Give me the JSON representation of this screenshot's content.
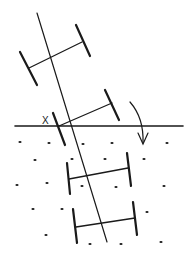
{
  "diagram": {
    "label_x": "X",
    "colors": {
      "ink": "#1a1a1a",
      "background": "#ffffff"
    },
    "ground_line": {
      "x1": 15,
      "y1": 126,
      "x2": 183,
      "y2": 126
    },
    "main_axis": {
      "x1": 37,
      "y1": 13,
      "x2": 107,
      "y2": 242
    },
    "rungs": [
      {
        "left_bar": [
          20,
          52,
          37,
          85
        ],
        "right_bar": [
          76,
          25,
          90,
          56
        ],
        "rung": [
          29,
          68,
          82,
          42
        ]
      },
      {
        "left_bar": [
          53,
          113,
          65,
          145
        ],
        "right_bar": [
          105,
          90,
          119,
          120
        ],
        "rung": [
          59,
          126,
          112,
          103
        ]
      },
      {
        "left_bar": [
          67,
          163,
          70,
          194
        ],
        "right_bar": [
          127,
          153,
          131,
          186
        ],
        "rung": [
          69,
          179,
          128,
          168
        ]
      },
      {
        "left_bar": [
          73,
          209,
          77,
          243
        ],
        "right_bar": [
          133,
          202,
          137,
          235
        ],
        "rung": [
          76,
          227,
          135,
          218
        ]
      }
    ],
    "rotation_arrow": {
      "path": "M130 102 Q144 118 143 143",
      "head": "M138 133 L143 144 L148 133"
    },
    "soil_dots": [
      [
        20,
        142
      ],
      [
        49,
        143
      ],
      [
        83,
        144
      ],
      [
        112,
        143
      ],
      [
        167,
        143
      ],
      [
        35,
        160
      ],
      [
        72,
        159
      ],
      [
        105,
        159
      ],
      [
        144,
        159
      ],
      [
        17,
        185
      ],
      [
        47,
        183
      ],
      [
        82,
        186
      ],
      [
        116,
        187
      ],
      [
        164,
        186
      ],
      [
        33,
        209
      ],
      [
        62,
        209
      ],
      [
        147,
        212
      ],
      [
        46,
        235
      ],
      [
        90,
        244
      ],
      [
        121,
        244
      ],
      [
        161,
        242
      ]
    ]
  }
}
